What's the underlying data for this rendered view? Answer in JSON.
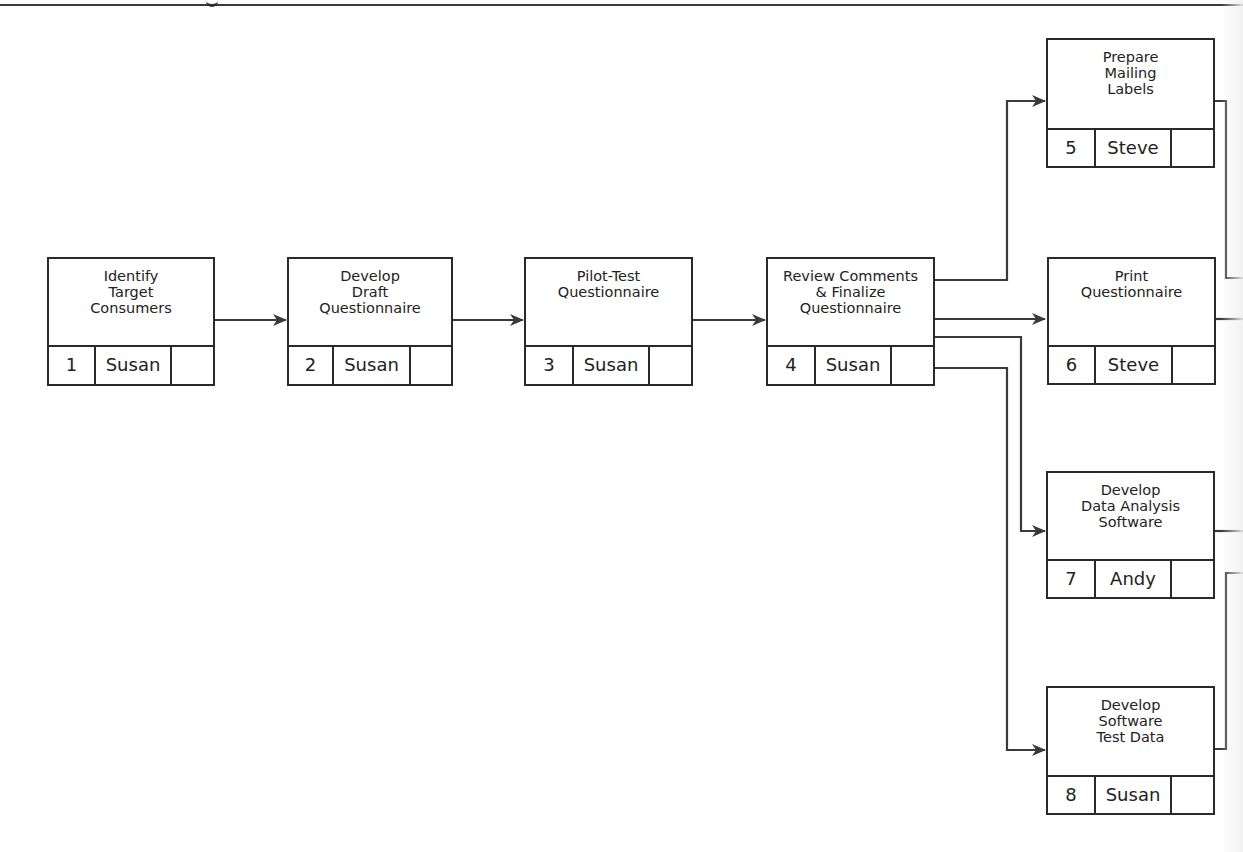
{
  "diagram": {
    "type": "network-diagram",
    "nodes": [
      {
        "id": 1,
        "title": "Identify\nTarget\nConsumers",
        "number": "1",
        "person": "Susan",
        "blank": ""
      },
      {
        "id": 2,
        "title": "Develop\nDraft\nQuestionnaire",
        "number": "2",
        "person": "Susan",
        "blank": ""
      },
      {
        "id": 3,
        "title": "Pilot-Test\nQuestionnaire",
        "number": "3",
        "person": "Susan",
        "blank": ""
      },
      {
        "id": 4,
        "title": "Review Comments\n& Finalize\nQuestionnaire",
        "number": "4",
        "person": "Susan",
        "blank": ""
      },
      {
        "id": 5,
        "title": "Prepare\nMailing\nLabels",
        "number": "5",
        "person": "Steve",
        "blank": ""
      },
      {
        "id": 6,
        "title": "Print\nQuestionnaire",
        "number": "6",
        "person": "Steve",
        "blank": ""
      },
      {
        "id": 7,
        "title": "Develop\nData Analysis\nSoftware",
        "number": "7",
        "person": "Andy",
        "blank": ""
      },
      {
        "id": 8,
        "title": "Develop\nSoftware\nTest Data",
        "number": "8",
        "person": "Susan",
        "blank": ""
      }
    ],
    "edges": [
      {
        "from": 1,
        "to": 2
      },
      {
        "from": 2,
        "to": 3
      },
      {
        "from": 3,
        "to": 4
      },
      {
        "from": 4,
        "to": 5
      },
      {
        "from": 4,
        "to": 6
      },
      {
        "from": 4,
        "to": 7
      },
      {
        "from": 4,
        "to": 8
      }
    ],
    "colors": {
      "line": "#3a3a3a",
      "box_border": "#2a2a2a",
      "background": "#ffffff"
    }
  }
}
